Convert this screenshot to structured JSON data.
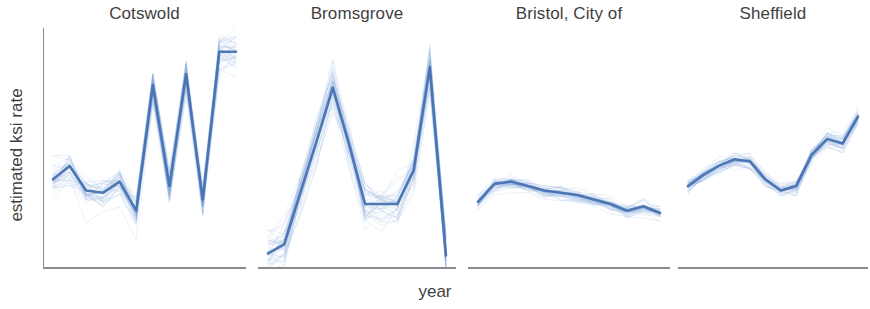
{
  "figure": {
    "xlabel": "year",
    "ylabel": "estimated ksi rate",
    "median_color": "#4771b2",
    "draw_color": "#6f9fd8",
    "axis_color": "#8a8a8d",
    "text_color": "#3f3f42",
    "background": "#ffffff"
  },
  "chart_data": {
    "type": "line",
    "title": "",
    "subtitle": "",
    "xlabel": "year",
    "ylabel": "estimated ksi rate",
    "grid": false,
    "legend": "none",
    "layout": "small-multiples, 1 row x 4 columns, shared y scale per panel",
    "xticklabels": [],
    "yticklabels": [],
    "ylim": [
      0,
      1
    ],
    "panels": [
      {
        "name": "Cotswold",
        "x": [
          0,
          1,
          2,
          3,
          4,
          5,
          6,
          7,
          8,
          9,
          10,
          11
        ],
        "series": [
          {
            "name": "median",
            "values": [
              0.36,
              0.42,
              0.31,
              0.3,
              0.35,
              0.22,
              0.78,
              0.33,
              0.83,
              0.27,
              0.93,
              0.93
            ]
          }
        ],
        "draws_count": 40,
        "draw_spread": 0.12
      },
      {
        "name": "Bromsgrove",
        "x": [
          0,
          1,
          2,
          3,
          4,
          5,
          6,
          7,
          8,
          9,
          10,
          11
        ],
        "series": [
          {
            "name": "median",
            "values": [
              0.03,
              0.07,
              0.3,
              0.53,
              0.77,
              0.52,
              0.25,
              0.25,
              0.25,
              0.4,
              0.86,
              0.02
            ]
          }
        ],
        "draws_count": 40,
        "draw_spread": 0.15
      },
      {
        "name": "Bristol, City of",
        "x": [
          0,
          1,
          2,
          3,
          4,
          5,
          6,
          7,
          8,
          9,
          10,
          11
        ],
        "series": [
          {
            "name": "median",
            "values": [
              0.26,
              0.34,
              0.35,
              0.33,
              0.31,
              0.3,
              0.29,
              0.27,
              0.25,
              0.22,
              0.24,
              0.21
            ]
          }
        ],
        "draws_count": 40,
        "draw_spread": 0.045
      },
      {
        "name": "Sheffield",
        "x": [
          0,
          1,
          2,
          3,
          4,
          5,
          6,
          7,
          8,
          9,
          10,
          11
        ],
        "series": [
          {
            "name": "median",
            "values": [
              0.33,
              0.38,
              0.42,
              0.45,
              0.44,
              0.36,
              0.31,
              0.33,
              0.47,
              0.54,
              0.52,
              0.64
            ]
          }
        ],
        "draws_count": 40,
        "draw_spread": 0.05
      }
    ]
  },
  "panel_geometry": [
    {
      "left": 43,
      "width": 203,
      "has_yaxis": true
    },
    {
      "left": 258,
      "width": 198,
      "has_yaxis": false
    },
    {
      "left": 468,
      "width": 202,
      "has_yaxis": false
    },
    {
      "left": 678,
      "width": 190,
      "has_yaxis": false
    }
  ]
}
